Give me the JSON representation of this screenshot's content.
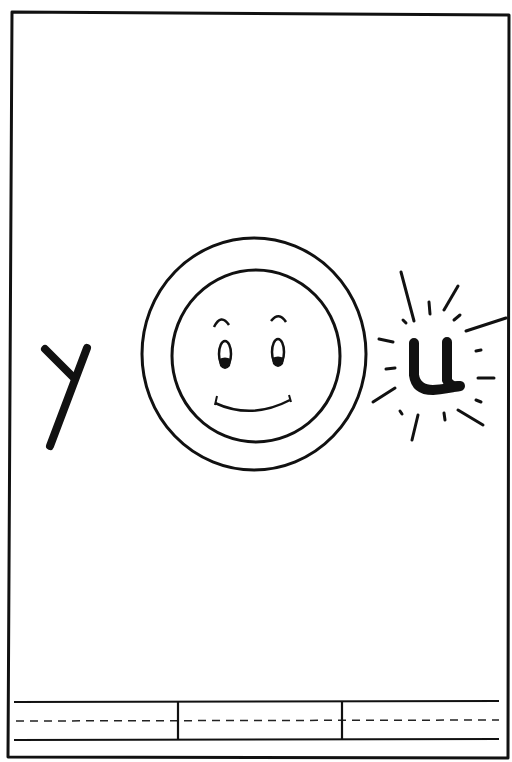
{
  "worksheet": {
    "word": "you",
    "letters": [
      {
        "char": "y",
        "style": "handwritten"
      },
      {
        "char": "o",
        "style": "smiley-face-circle"
      },
      {
        "char": "u",
        "style": "handwritten-with-sparkle-rays"
      }
    ],
    "writing_area": {
      "sections": 3,
      "guide_lines": [
        "top-solid",
        "middle-dashed",
        "bottom-solid"
      ]
    },
    "colors": {
      "ink": "#111111",
      "paper": "#ffffff"
    }
  }
}
